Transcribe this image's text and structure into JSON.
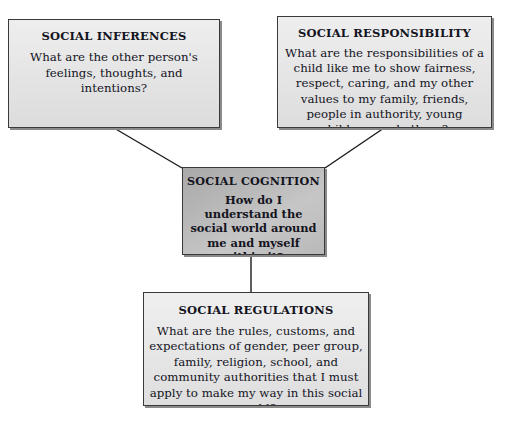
{
  "diagram": {
    "background_color": "#ffffff",
    "line_color": "#1a1a1a",
    "border_color": "#3a3a3a",
    "shadow_color": "#8a8a8a",
    "text_color": "#14141e",
    "center_fill": "#b6b6b6",
    "outer_fill": "#e6e6e6"
  },
  "nodes": {
    "inferences": {
      "title": "SOCIAL INFERENCES",
      "body": "What are the other person's feelings, thoughts, and intentions?"
    },
    "responsibility": {
      "title": "SOCIAL RESPONSIBILITY",
      "body": "What are the responsibilities of a child like me to show fairness, respect, caring, and my other values to my family, friends, people in authority, young children, and others?"
    },
    "cognition": {
      "title": "SOCIAL COGNITION",
      "body": "How do I understand the social world around me and myself within it?"
    },
    "regulations": {
      "title": "SOCIAL REGULATIONS",
      "body": "What are the rules, customs, and expectations of gender, peer group, family, religion, school, and community authorities that I must apply to make my way in this social world?"
    }
  },
  "connectors": [
    {
      "name": "inferences-to-cognition",
      "from": "inferences",
      "to": "cognition",
      "x1": 114,
      "y1": 128,
      "x2": 182,
      "y2": 168
    },
    {
      "name": "responsibility-to-cognition",
      "from": "responsibility",
      "to": "cognition",
      "x1": 384,
      "y1": 128,
      "x2": 325,
      "y2": 168
    },
    {
      "name": "cognition-to-regulations",
      "from": "cognition",
      "to": "regulations",
      "x1": 251,
      "y1": 255,
      "x2": 251,
      "y2": 292
    }
  ]
}
